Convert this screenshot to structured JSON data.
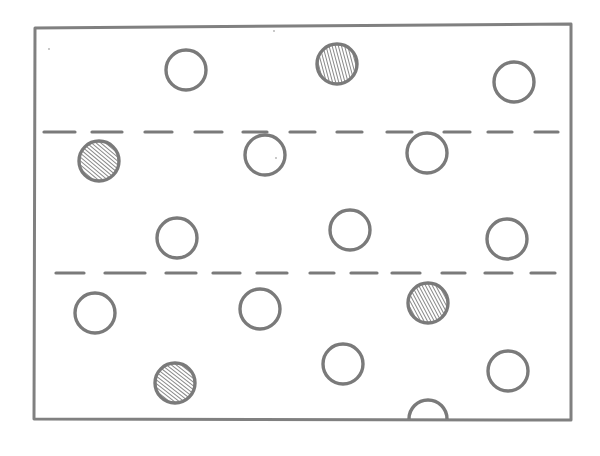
{
  "diagram": {
    "type": "hand-drawn layout sketch",
    "canvas": {
      "width": 600,
      "height": 456,
      "background": "#ffffff"
    },
    "colors": {
      "stroke": "#7a7a7a",
      "hatch": "#8a8a8a",
      "frame": "#808080"
    },
    "frame": {
      "points": [
        [
          35,
          28
        ],
        [
          571,
          24
        ],
        [
          571,
          420
        ],
        [
          34,
          419
        ]
      ],
      "stroke_width": 3
    },
    "dashed_lines": [
      {
        "name": "upper-divider",
        "y": 132,
        "dashes": [
          [
            44,
            75
          ],
          [
            92,
            122
          ],
          [
            145,
            172
          ],
          [
            195,
            222
          ],
          [
            243,
            267
          ],
          [
            290,
            315
          ],
          [
            337,
            362
          ],
          [
            387,
            412
          ],
          [
            444,
            470
          ],
          [
            488,
            512
          ],
          [
            535,
            558
          ]
        ]
      },
      {
        "name": "lower-divider",
        "y": 273,
        "dashes": [
          [
            56,
            84
          ],
          [
            105,
            145
          ],
          [
            166,
            196
          ],
          [
            213,
            240
          ],
          [
            257,
            287
          ],
          [
            310,
            334
          ],
          [
            351,
            377
          ],
          [
            392,
            420
          ],
          [
            442,
            465
          ],
          [
            485,
            512
          ],
          [
            531,
            555
          ]
        ]
      }
    ],
    "circles": [
      {
        "id": "c1",
        "cx": 186,
        "cy": 70,
        "r": 20,
        "filled": false
      },
      {
        "id": "c2",
        "cx": 337,
        "cy": 64,
        "r": 20,
        "filled": true,
        "hatch_angle": 75
      },
      {
        "id": "c3",
        "cx": 514,
        "cy": 82,
        "r": 20,
        "filled": false
      },
      {
        "id": "c4",
        "cx": 99,
        "cy": 161,
        "r": 20,
        "filled": true,
        "hatch_angle": 40
      },
      {
        "id": "c5",
        "cx": 265,
        "cy": 155,
        "r": 20,
        "filled": false
      },
      {
        "id": "c6",
        "cx": 427,
        "cy": 153,
        "r": 20,
        "filled": false
      },
      {
        "id": "c7",
        "cx": 177,
        "cy": 238,
        "r": 20,
        "filled": false
      },
      {
        "id": "c8",
        "cx": 350,
        "cy": 230,
        "r": 20,
        "filled": false
      },
      {
        "id": "c9",
        "cx": 507,
        "cy": 239,
        "r": 20,
        "filled": false
      },
      {
        "id": "c10",
        "cx": 95,
        "cy": 313,
        "r": 20,
        "filled": false
      },
      {
        "id": "c11",
        "cx": 260,
        "cy": 309,
        "r": 20,
        "filled": false
      },
      {
        "id": "c12",
        "cx": 428,
        "cy": 303,
        "r": 20,
        "filled": true,
        "hatch_angle": 62
      },
      {
        "id": "c13",
        "cx": 175,
        "cy": 383,
        "r": 20,
        "filled": true,
        "hatch_angle": 38
      },
      {
        "id": "c14",
        "cx": 343,
        "cy": 364,
        "r": 20,
        "filled": false
      },
      {
        "id": "c15",
        "cx": 508,
        "cy": 371,
        "r": 20,
        "filled": false
      }
    ],
    "half_circle": {
      "cx": 428,
      "cy": 419,
      "r": 19,
      "orientation": "up"
    },
    "stray_marks": [
      {
        "x": 49,
        "y": 49
      },
      {
        "x": 274,
        "y": 31
      },
      {
        "x": 276,
        "y": 158
      }
    ]
  }
}
